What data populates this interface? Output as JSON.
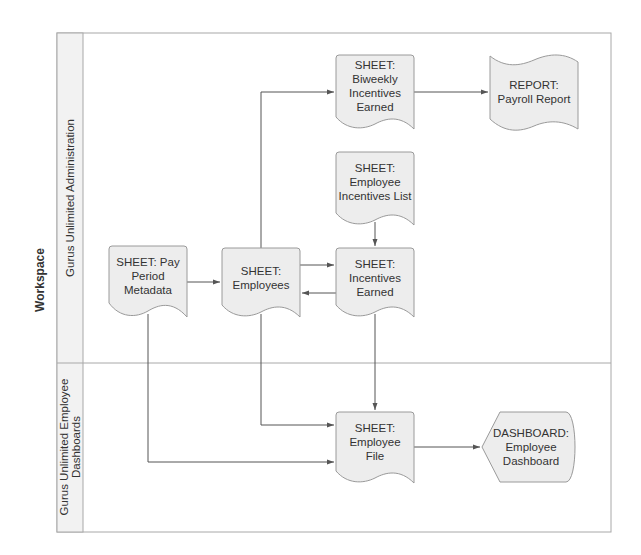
{
  "diagram": {
    "type": "swimlane-flowchart",
    "pool_label": "Workspace",
    "lanes": [
      {
        "id": "admin",
        "label": "Gurus Unlimited Administration"
      },
      {
        "id": "dashboards",
        "label_line1": "Gurus Unlimited Employee",
        "label_line2": "Dashboards"
      }
    ],
    "nodes": {
      "pay_period": {
        "line1": "SHEET: Pay",
        "line2": "Period",
        "line3": "Metadata",
        "shape": "document",
        "lane": "admin"
      },
      "employees": {
        "line1": "SHEET:",
        "line2": "Employees",
        "shape": "document",
        "lane": "admin"
      },
      "incentives_earned": {
        "line1": "SHEET:",
        "line2": "Incentives",
        "line3": "Earned",
        "shape": "document",
        "lane": "admin"
      },
      "biweekly": {
        "line1": "SHEET:",
        "line2": "Biweekly",
        "line3": "Incentives",
        "line4": "Earned",
        "shape": "document",
        "lane": "admin"
      },
      "incentives_list": {
        "line1": "SHEET:",
        "line2": "Employee",
        "line3": "Incentives List",
        "shape": "document",
        "lane": "admin"
      },
      "payroll_report": {
        "line1": "REPORT:",
        "line2": "Payroll Report",
        "shape": "tape",
        "lane": "admin"
      },
      "employee_file": {
        "line1": "SHEET:",
        "line2": "Employee",
        "line3": "File",
        "shape": "document",
        "lane": "dashboards"
      },
      "dashboard": {
        "line1": "DASHBOARD:",
        "line2": "Employee",
        "line3": "Dashboard",
        "shape": "display",
        "lane": "dashboards"
      }
    },
    "edges": [
      {
        "from": "pay_period",
        "to": "employees"
      },
      {
        "from": "employees",
        "to": "incentives_earned"
      },
      {
        "from": "incentives_earned",
        "to": "employees"
      },
      {
        "from": "employees",
        "to": "biweekly"
      },
      {
        "from": "biweekly",
        "to": "payroll_report"
      },
      {
        "from": "incentives_list",
        "to": "incentives_earned"
      },
      {
        "from": "incentives_earned",
        "to": "employee_file"
      },
      {
        "from": "employees",
        "to": "employee_file"
      },
      {
        "from": "pay_period",
        "to": "employee_file"
      },
      {
        "from": "employee_file",
        "to": "dashboard"
      }
    ],
    "colors": {
      "node_fill": "#ededed",
      "node_stroke": "#9a9a9a",
      "lane_header_fill": "#f2f2f2",
      "frame_stroke": "#a8a8a8",
      "edge": "#555555",
      "text": "#333333"
    }
  }
}
